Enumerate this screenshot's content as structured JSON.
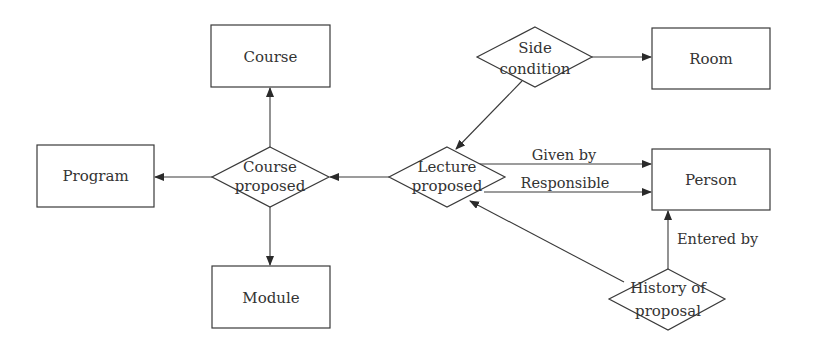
{
  "diagram": {
    "type": "entity-relationship",
    "entities": [
      {
        "id": "course",
        "label": "Course"
      },
      {
        "id": "program",
        "label": "Program"
      },
      {
        "id": "module",
        "label": "Module"
      },
      {
        "id": "room",
        "label": "Room"
      },
      {
        "id": "person",
        "label": "Person"
      }
    ],
    "relationships": [
      {
        "id": "course_proposed",
        "line1": "Course",
        "line2": "proposed"
      },
      {
        "id": "lecture_proposed",
        "line1": "Lecture",
        "line2": "proposed"
      },
      {
        "id": "side_condition",
        "line1": "Side",
        "line2": "condition"
      },
      {
        "id": "history_of_proposal",
        "line1": "History of",
        "line2": "proposal"
      }
    ],
    "edges": [
      {
        "from": "course_proposed",
        "to": "course",
        "label": ""
      },
      {
        "from": "course_proposed",
        "to": "program",
        "label": ""
      },
      {
        "from": "course_proposed",
        "to": "module",
        "label": ""
      },
      {
        "from": "lecture_proposed",
        "to": "course_proposed",
        "label": ""
      },
      {
        "from": "side_condition",
        "to": "lecture_proposed",
        "label": ""
      },
      {
        "from": "side_condition",
        "to": "room",
        "label": ""
      },
      {
        "from": "lecture_proposed",
        "to": "person",
        "label": "Given by"
      },
      {
        "from": "lecture_proposed",
        "to": "person",
        "label": "Responsible"
      },
      {
        "from": "history_of_proposal",
        "to": "person",
        "label": "Entered by"
      },
      {
        "from": "history_of_proposal",
        "to": "lecture_proposed",
        "label": ""
      }
    ],
    "edge_labels": {
      "given_by": "Given by",
      "responsible": "Responsible",
      "entered_by": "Entered by"
    }
  }
}
